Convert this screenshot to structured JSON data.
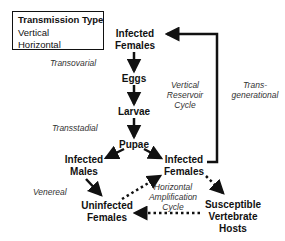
{
  "legend": {
    "title": "Transmission Type",
    "items": [
      {
        "label": "Vertical",
        "style": "solid"
      },
      {
        "label": "Horizontal",
        "style": "dotted"
      }
    ]
  },
  "nodes": {
    "infected_females_top": {
      "line1": "Infected",
      "line2": "Females"
    },
    "eggs": {
      "line1": "Eggs"
    },
    "larvae": {
      "line1": "Larvae"
    },
    "pupae": {
      "line1": "Pupae"
    },
    "infected_males": {
      "line1": "Infected",
      "line2": "Males"
    },
    "infected_females_mid": {
      "line1": "Infected",
      "line2": "Females"
    },
    "uninfected_females": {
      "line1": "Uninfected",
      "line2": "Females"
    },
    "susceptible_hosts": {
      "line1": "Susceptible",
      "line2": "Vertebrate",
      "line3": "Hosts"
    }
  },
  "labels": {
    "transovarial": "Transovarial",
    "transstadial": "Transstadial",
    "venereal": "Venereal",
    "vertical_cycle": {
      "line1": "Vertical",
      "line2": "Reservoir",
      "line3": "Cycle"
    },
    "transgenerational": {
      "line1": "Trans-",
      "line2": "generational"
    },
    "horizontal_cycle": {
      "line1": "Horizontal",
      "line2": "Amplification",
      "line3": "Cycle"
    }
  },
  "colors": {
    "ink": "#111111",
    "italic_text": "#333333",
    "background": "#ffffff"
  }
}
